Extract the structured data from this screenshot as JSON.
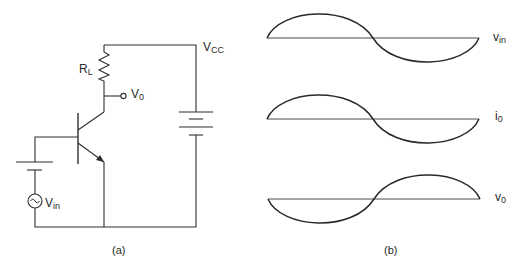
{
  "figure": {
    "panel_a": {
      "caption": "(a)",
      "title": "Common-emitter transistor amplifier circuit",
      "components": [
        {
          "id": "RL",
          "type": "resistor",
          "label_main": "R",
          "label_sub": "L"
        },
        {
          "id": "Q1",
          "type": "npn-transistor",
          "label_main": "",
          "label_sub": ""
        },
        {
          "id": "VCC",
          "type": "dc-battery",
          "label_main": "V",
          "label_sub": "CC"
        },
        {
          "id": "VBB",
          "type": "dc-battery",
          "label_main": "",
          "label_sub": ""
        },
        {
          "id": "Vin",
          "type": "ac-source",
          "label_main": "V",
          "label_sub": "in"
        },
        {
          "id": "V0",
          "type": "output-terminal",
          "label_main": "V",
          "label_sub": "0"
        }
      ]
    },
    "panel_b": {
      "caption": "(b)",
      "title": "Input and output waveforms",
      "waveforms": [
        {
          "id": "vin",
          "label_main": "v",
          "label_sub": "in",
          "phase": "in-phase",
          "shape": "sine"
        },
        {
          "id": "i0",
          "label_main": "i",
          "label_sub": "0",
          "phase": "in-phase",
          "shape": "sine"
        },
        {
          "id": "v0",
          "label_main": "v",
          "label_sub": "0",
          "phase": "inverted (180°)",
          "shape": "sine"
        }
      ]
    }
  }
}
